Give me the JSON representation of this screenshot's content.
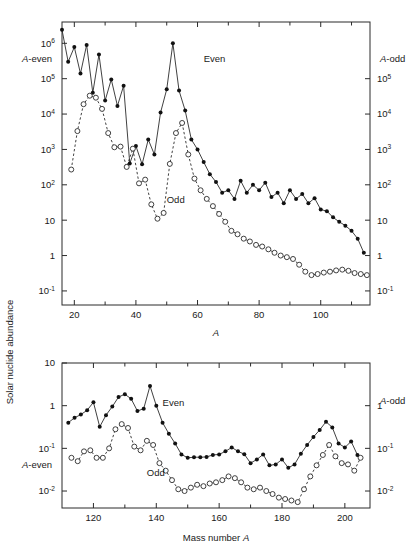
{
  "figure": {
    "ylabel_rotated": "Solar nuclide abundance",
    "panels": [
      "top",
      "bottom"
    ]
  },
  "chart_data": [
    {
      "type": "scatter",
      "panel": "top",
      "title": "",
      "xlabel": "A",
      "ylabel": "Solar nuclide abundance",
      "ylabel_left": "A-even",
      "ylabel_right": "A-odd",
      "xlim": [
        16,
        116
      ],
      "xticks": [
        20,
        40,
        60,
        80,
        100
      ],
      "xtick_labels": [
        "20",
        "40",
        "60",
        "80",
        "100"
      ],
      "xminorticks": [
        30,
        50,
        70,
        90,
        110
      ],
      "ylim_left": [
        0.04,
        4000000
      ],
      "yticks_left": [
        1000000,
        100000,
        10000,
        1000,
        100,
        10,
        1,
        0.1
      ],
      "ytick_labels_left": [
        "10⁶",
        "10⁵",
        "10⁴",
        "10³",
        "10²",
        "10",
        "1",
        "10⁻¹"
      ],
      "ylim_right": [
        0.04,
        4000000
      ],
      "yticks_right": [
        100000,
        10000,
        1000,
        100,
        10,
        1,
        0.1
      ],
      "ytick_labels_right": [
        "10⁵",
        "10⁴",
        "10³",
        "10²",
        "10",
        "1",
        "10⁻¹"
      ],
      "grid": false,
      "annotations": [
        {
          "text": "Even",
          "x": 62,
          "y": 300000
        },
        {
          "text": "Odd",
          "x": 50,
          "y": 30
        },
        {
          "text": "A-even",
          "x_axis": "left-label"
        },
        {
          "text": "A-odd",
          "x_axis": "right-label"
        }
      ],
      "series": [
        {
          "name": "Even",
          "marker": "filled-circle",
          "line": "solid",
          "axis": "left",
          "x": [
            16,
            18,
            20,
            22,
            24,
            26,
            28,
            30,
            32,
            34,
            36,
            38,
            40,
            42,
            44,
            46,
            48,
            50,
            52,
            54,
            56,
            58,
            60,
            62,
            64,
            66,
            68,
            70,
            72,
            74,
            76,
            78,
            80,
            82,
            84,
            86,
            88,
            90,
            92,
            94,
            96,
            98,
            100,
            102,
            104,
            106,
            108,
            110,
            112,
            114
          ],
          "y": [
            2400000,
            300000,
            780000,
            140000,
            900000,
            40000,
            480000,
            24000,
            95000,
            17000,
            63000,
            400,
            1250,
            380,
            1900,
            720,
            11000,
            50000,
            1000000,
            46000,
            12500,
            1900,
            1000,
            440,
            200,
            120,
            60,
            70,
            40,
            130,
            60,
            100,
            70,
            115,
            45,
            60,
            30,
            70,
            40,
            55,
            30,
            42,
            20,
            18,
            12,
            9,
            7,
            5,
            3,
            1.2
          ]
        },
        {
          "name": "Odd",
          "marker": "open-circle",
          "line": "dashed",
          "axis": "right",
          "x": [
            19,
            21,
            23,
            25,
            27,
            29,
            31,
            33,
            35,
            37,
            39,
            41,
            43,
            45,
            47,
            49,
            51,
            53,
            55,
            57,
            59,
            61,
            63,
            65,
            67,
            69,
            71,
            73,
            75,
            77,
            79,
            81,
            83,
            85,
            87,
            89,
            91,
            93,
            95,
            97,
            99,
            101,
            103,
            105,
            107,
            109,
            111,
            113,
            115
          ],
          "y": [
            270,
            3300,
            19000,
            33000,
            29000,
            14000,
            2900,
            1150,
            1200,
            320,
            1050,
            110,
            140,
            28,
            11,
            16,
            390,
            2900,
            5600,
            720,
            150,
            70,
            40,
            25,
            15,
            9,
            5,
            4,
            3,
            2.5,
            2,
            1.8,
            1.5,
            1.2,
            1,
            0.9,
            0.8,
            0.55,
            0.35,
            0.28,
            0.3,
            0.33,
            0.35,
            0.38,
            0.4,
            0.37,
            0.32,
            0.3,
            0.28
          ]
        }
      ]
    },
    {
      "type": "scatter",
      "panel": "bottom",
      "title": "",
      "xlabel": "Mass number A",
      "ylabel_left": "A-even",
      "ylabel_right": "A-odd",
      "xlim": [
        110,
        208
      ],
      "xticks": [
        120,
        140,
        160,
        180,
        200
      ],
      "xtick_labels": [
        "120",
        "140",
        "160",
        "180",
        "200"
      ],
      "xminorticks": [
        130,
        150,
        170,
        190
      ],
      "ylim_left": [
        0.004,
        10
      ],
      "yticks_left": [
        10,
        1,
        0.1,
        0.01
      ],
      "ytick_labels_left": [
        "10",
        "1",
        "10⁻¹",
        "10⁻²"
      ],
      "ylim_right": [
        0.004,
        10
      ],
      "yticks_right": [
        1,
        0.1,
        0.01
      ],
      "ytick_labels_right": [
        "1",
        "10⁻¹",
        "10⁻²"
      ],
      "grid": false,
      "annotations": [
        {
          "text": "Even",
          "x": 142,
          "y": 1.0
        },
        {
          "text": "Odd",
          "x": 137,
          "y": 0.022
        },
        {
          "text": "A-even",
          "x_axis": "left-label"
        },
        {
          "text": "A-odd",
          "x_axis": "right-label"
        }
      ],
      "series": [
        {
          "name": "Even",
          "marker": "filled-circle",
          "line": "solid",
          "axis": "left",
          "x": [
            112,
            114,
            116,
            118,
            120,
            122,
            124,
            126,
            128,
            130,
            132,
            134,
            136,
            138,
            140,
            142,
            144,
            146,
            148,
            150,
            152,
            154,
            156,
            158,
            160,
            162,
            164,
            166,
            168,
            170,
            172,
            174,
            176,
            178,
            180,
            182,
            184,
            186,
            188,
            190,
            192,
            194,
            196,
            198,
            200,
            202,
            204
          ],
          "y": [
            0.4,
            0.52,
            0.62,
            0.78,
            1.2,
            0.32,
            0.6,
            0.95,
            1.6,
            1.85,
            1.45,
            0.75,
            0.85,
            2.9,
            1.0,
            0.4,
            0.22,
            0.13,
            0.072,
            0.06,
            0.062,
            0.062,
            0.063,
            0.07,
            0.072,
            0.085,
            0.105,
            0.085,
            0.073,
            0.045,
            0.055,
            0.072,
            0.04,
            0.042,
            0.055,
            0.035,
            0.042,
            0.075,
            0.12,
            0.185,
            0.27,
            0.42,
            0.31,
            0.13,
            0.105,
            0.145,
            0.07
          ]
        },
        {
          "name": "Odd",
          "marker": "open-circle",
          "line": "dashed",
          "axis": "right",
          "x": [
            113,
            115,
            117,
            119,
            121,
            123,
            125,
            127,
            129,
            131,
            133,
            135,
            137,
            139,
            141,
            143,
            145,
            147,
            149,
            151,
            153,
            155,
            157,
            159,
            161,
            163,
            165,
            167,
            169,
            171,
            173,
            175,
            177,
            179,
            181,
            183,
            185,
            187,
            189,
            191,
            193,
            195,
            197,
            199,
            201,
            203,
            205
          ],
          "y": [
            0.06,
            0.05,
            0.085,
            0.09,
            0.06,
            0.06,
            0.1,
            0.28,
            0.37,
            0.3,
            0.11,
            0.09,
            0.15,
            0.12,
            0.045,
            0.03,
            0.018,
            0.011,
            0.01,
            0.012,
            0.014,
            0.013,
            0.015,
            0.016,
            0.018,
            0.022,
            0.02,
            0.016,
            0.012,
            0.011,
            0.012,
            0.01,
            0.0085,
            0.007,
            0.0065,
            0.006,
            0.0055,
            0.011,
            0.022,
            0.04,
            0.07,
            0.12,
            0.065,
            0.045,
            0.042,
            0.03,
            0.06
          ]
        }
      ]
    }
  ]
}
